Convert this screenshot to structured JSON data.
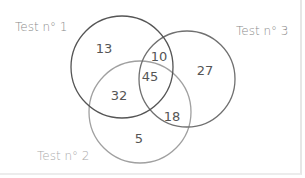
{
  "diagram": {
    "type": "venn-3",
    "sets": [
      {
        "label": "Test n° 1",
        "color": "#5a5a5a"
      },
      {
        "label": "Test n° 2",
        "color": "#9a9a9a"
      },
      {
        "label": "Test n° 3",
        "color": "#707070"
      }
    ],
    "regions": {
      "only_1": "13",
      "only_3": "27",
      "only_2": "5",
      "1_and_3": "10",
      "1_and_2": "32",
      "2_and_3": "18",
      "all": "45"
    }
  }
}
